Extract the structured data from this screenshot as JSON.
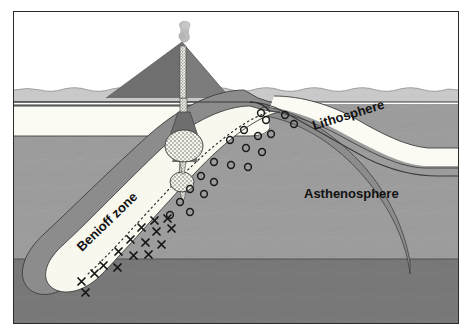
{
  "figure": {
    "labels": {
      "lithosphere": "Lithosphere",
      "asthenosphere": "Asthenosphere",
      "benioff_zone": "Benioff zone"
    },
    "colors": {
      "frame_border": "#2b2b2b",
      "background": "#ffffff",
      "ocean_water": "#c9c9c9",
      "continent_volcano": "#7d7d7d",
      "lithosphere_band": "#fbfbf6",
      "asthenosphere": "#9c9c9c",
      "deep_mantle": "#777777",
      "slab_core": "#f7f7ee",
      "slab_crust": "#8a8a8a",
      "magma_stipple": "#efefe6",
      "smoke_plume": "#b9b9b9",
      "outline": "#3a3a3a"
    },
    "features": {
      "volcano": "volcano-cone",
      "plume": "smoke-plume",
      "conduit": "magma-conduit",
      "magma_chambers": 2,
      "earthquake_foci_count": 20,
      "metamorphism_marks_count": 16
    },
    "earthquake_foci": [
      [
        247,
        101
      ],
      [
        270,
        103
      ],
      [
        278,
        110
      ],
      [
        288,
        118
      ],
      [
        231,
        117
      ],
      [
        243,
        123
      ],
      [
        253,
        127
      ],
      [
        263,
        120
      ],
      [
        220,
        128
      ],
      [
        235,
        136
      ],
      [
        248,
        143
      ],
      [
        198,
        147
      ],
      [
        210,
        155
      ],
      [
        222,
        149
      ],
      [
        186,
        162
      ],
      [
        196,
        170
      ],
      [
        173,
        180
      ],
      [
        181,
        188
      ],
      [
        162,
        196
      ],
      [
        170,
        205
      ]
    ],
    "metamorphism_marks": [
      [
        121,
        215
      ],
      [
        133,
        211
      ],
      [
        142,
        207
      ],
      [
        152,
        210
      ],
      [
        112,
        224
      ],
      [
        124,
        228
      ],
      [
        136,
        222
      ],
      [
        147,
        226
      ],
      [
        102,
        238
      ],
      [
        114,
        243
      ],
      [
        126,
        236
      ],
      [
        138,
        241
      ],
      [
        86,
        250
      ],
      [
        97,
        255
      ],
      [
        108,
        248
      ],
      [
        75,
        263
      ]
    ]
  }
}
